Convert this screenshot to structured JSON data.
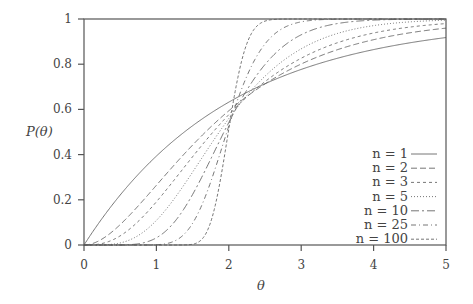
{
  "chart_data": {
    "type": "line",
    "title": "",
    "xlabel": "θ",
    "ylabel": "P(θ)",
    "xlim": [
      0,
      5
    ],
    "ylim": [
      0,
      1
    ],
    "xticks": [
      "0",
      "1",
      "2",
      "3",
      "4",
      "5"
    ],
    "yticks": [
      "0",
      "0.2",
      "0.4",
      "0.6",
      "0.8",
      "1"
    ],
    "grid": false,
    "legend_position": "lower right (inside)",
    "x": [
      0,
      0.5,
      1,
      1.5,
      2,
      2.5,
      3,
      3.5,
      4,
      4.5,
      5
    ],
    "series": [
      {
        "name": "n = 1",
        "n": 1,
        "dash": "",
        "values": [
          0,
          0.221,
          0.393,
          0.528,
          0.632,
          0.713,
          0.777,
          0.826,
          0.865,
          0.895,
          0.918
        ]
      },
      {
        "name": "n = 2",
        "n": 2,
        "dash": "6,3",
        "values": [
          0,
          0.09,
          0.264,
          0.442,
          0.594,
          0.713,
          0.801,
          0.864,
          0.908,
          0.939,
          0.96
        ]
      },
      {
        "name": "n = 3",
        "n": 3,
        "dash": "3,3",
        "values": [
          0,
          0.04,
          0.191,
          0.39,
          0.577,
          0.724,
          0.826,
          0.894,
          0.938,
          0.964,
          0.98
        ]
      },
      {
        "name": "n = 5",
        "n": 5,
        "dash": "1,2",
        "values": [
          0,
          0.009,
          0.109,
          0.316,
          0.56,
          0.749,
          0.868,
          0.936,
          0.971,
          0.987,
          0.995
        ]
      },
      {
        "name": "n = 10",
        "n": 10,
        "dash": "8,3,2,3",
        "values": [
          0,
          0.0,
          0.032,
          0.224,
          0.542,
          0.803,
          0.93,
          0.978,
          0.995,
          0.999,
          1.0
        ]
      },
      {
        "name": "n = 25",
        "n": 25,
        "dash": "5,3,1,3",
        "values": [
          0,
          0.0,
          0.002,
          0.102,
          0.527,
          0.881,
          0.984,
          0.999,
          1.0,
          1.0,
          1.0
        ]
      },
      {
        "name": "n = 100",
        "n": 100,
        "dash": "3,2",
        "values": [
          0,
          0.0,
          0.0,
          0.006,
          0.513,
          0.994,
          1.0,
          1.0,
          1.0,
          1.0,
          1.0
        ]
      }
    ]
  },
  "colors": {
    "axis": "#555555",
    "lines": "#666666",
    "text": "#444444",
    "background": "#ffffff"
  }
}
